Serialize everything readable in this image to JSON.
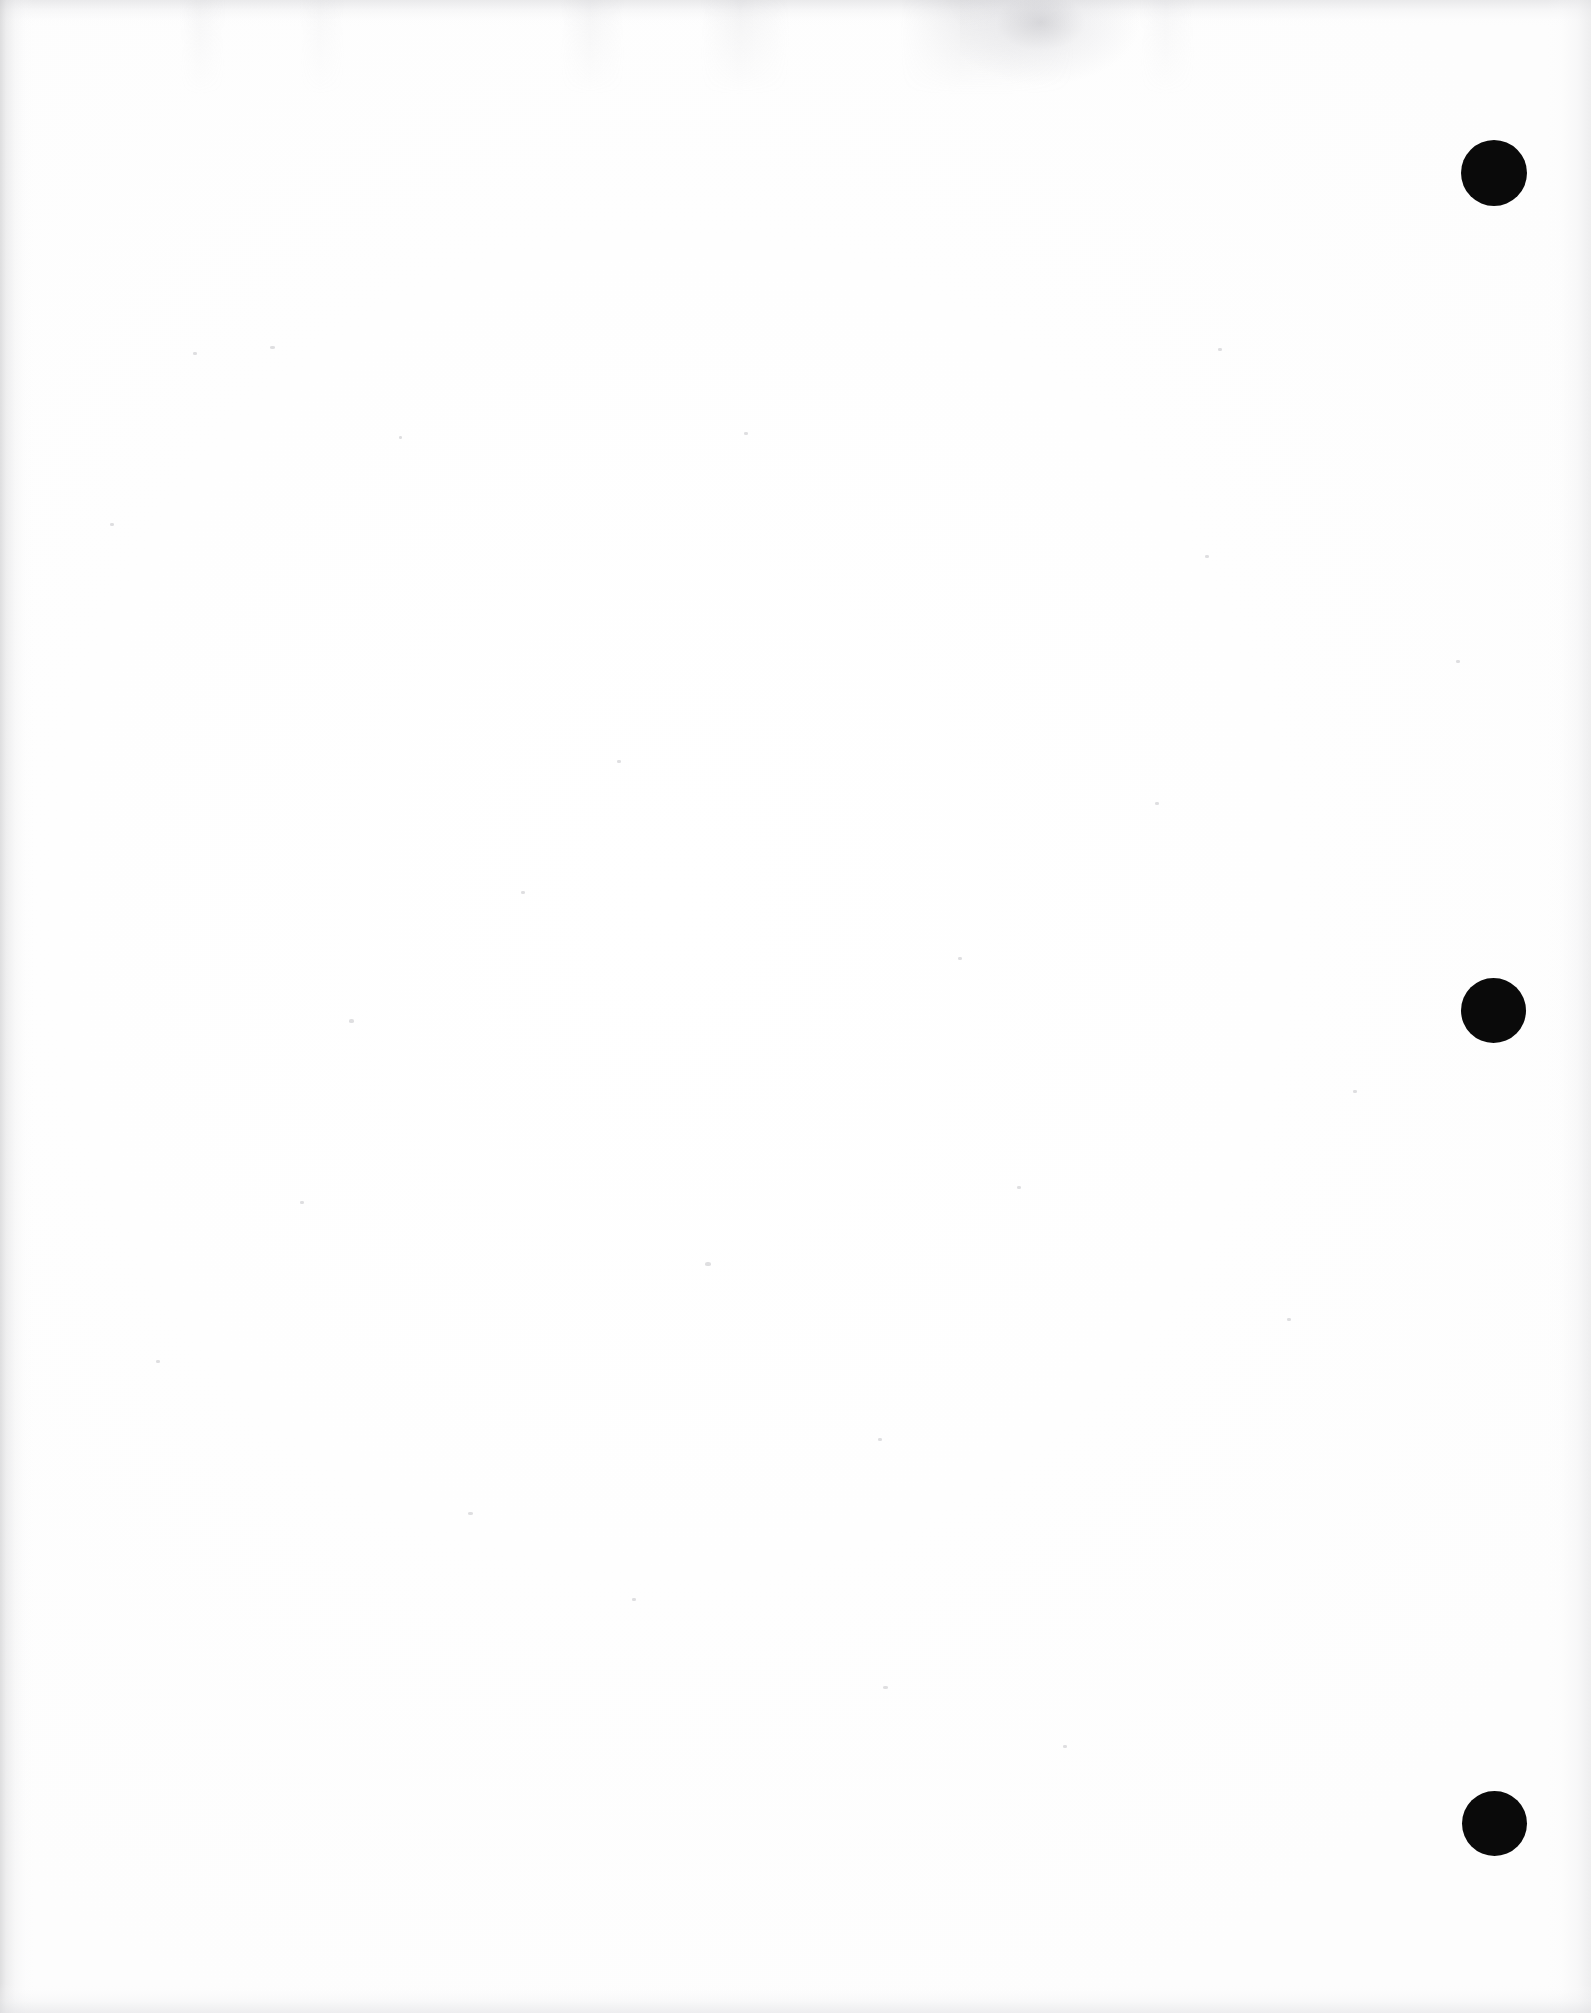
{
  "document": {
    "page_kind": "scanned-blank-page",
    "title": "Scanned blank page",
    "background_color": "#ffffff",
    "width_px": 1591,
    "height_px": 2013,
    "visible_text": "",
    "body_text": "",
    "notes_label": ""
  },
  "marks": {
    "color": "#0a0a0a",
    "count_label": "3",
    "items": [
      {
        "name": "registration-mark-top",
        "cx": 1494,
        "cy": 173,
        "d": 66
      },
      {
        "name": "registration-mark-middle",
        "cx": 1493,
        "cy": 1010,
        "d": 65
      },
      {
        "name": "registration-mark-bottom",
        "cx": 1494,
        "cy": 1823,
        "d": 65
      }
    ]
  },
  "artifacts": {
    "edge_shadow_color": "#d4d4d8",
    "streak_color": "#b4b4ba",
    "speck_color": "#96969c",
    "specks": [
      {
        "x": 270,
        "y": 346,
        "w": 5,
        "h": 3
      },
      {
        "x": 193,
        "y": 352,
        "w": 4,
        "h": 3
      },
      {
        "x": 349,
        "y": 1019,
        "w": 5,
        "h": 4
      },
      {
        "x": 110,
        "y": 523,
        "w": 4,
        "h": 3
      },
      {
        "x": 399,
        "y": 436,
        "w": 3,
        "h": 3
      },
      {
        "x": 705,
        "y": 1262,
        "w": 6,
        "h": 4
      },
      {
        "x": 878,
        "y": 1438,
        "w": 4,
        "h": 3
      },
      {
        "x": 1218,
        "y": 348,
        "w": 4,
        "h": 3
      },
      {
        "x": 958,
        "y": 957,
        "w": 4,
        "h": 3
      },
      {
        "x": 1205,
        "y": 555,
        "w": 4,
        "h": 3
      },
      {
        "x": 521,
        "y": 891,
        "w": 4,
        "h": 3
      },
      {
        "x": 1017,
        "y": 1186,
        "w": 4,
        "h": 3
      },
      {
        "x": 468,
        "y": 1512,
        "w": 5,
        "h": 3
      },
      {
        "x": 1287,
        "y": 1318,
        "w": 4,
        "h": 3
      },
      {
        "x": 883,
        "y": 1686,
        "w": 5,
        "h": 3
      },
      {
        "x": 632,
        "y": 1598,
        "w": 4,
        "h": 3
      },
      {
        "x": 1155,
        "y": 802,
        "w": 4,
        "h": 3
      },
      {
        "x": 300,
        "y": 1201,
        "w": 4,
        "h": 3
      },
      {
        "x": 1456,
        "y": 660,
        "w": 4,
        "h": 3
      },
      {
        "x": 744,
        "y": 432,
        "w": 4,
        "h": 3
      },
      {
        "x": 156,
        "y": 1360,
        "w": 4,
        "h": 3
      },
      {
        "x": 1063,
        "y": 1745,
        "w": 4,
        "h": 3
      },
      {
        "x": 617,
        "y": 760,
        "w": 4,
        "h": 3
      },
      {
        "x": 1353,
        "y": 1090,
        "w": 4,
        "h": 3
      }
    ]
  }
}
